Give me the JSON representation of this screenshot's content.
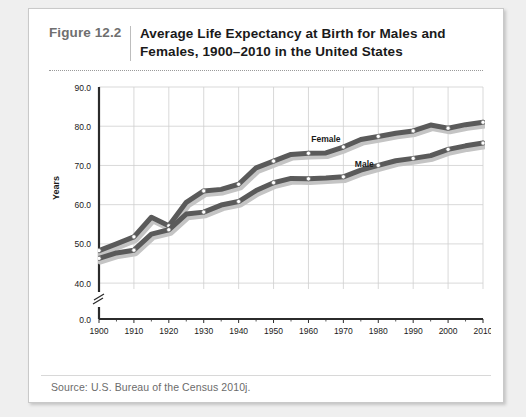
{
  "figure": {
    "number": "Figure 12.2",
    "title": "Average Life Expectancy at Birth for Males and Females, 1900–2010 in the United States",
    "source": "Source:  U.S. Bureau of the Census 2010j."
  },
  "chart_data": {
    "type": "line",
    "xlabel": "",
    "ylabel": "Years",
    "xlim": [
      1900,
      2010
    ],
    "ylim": [
      38.5,
      90.0
    ],
    "y_axis_break": true,
    "grid": true,
    "legend": "inline-annotations",
    "yticks": [
      "0.0",
      "40.0",
      "50.0",
      "60.0",
      "70.0",
      "80.0",
      "90.0"
    ],
    "ytick_values": [
      0.0,
      40.0,
      50.0,
      60.0,
      70.0,
      80.0,
      90.0
    ],
    "xticks": [
      "1900",
      "1910",
      "1920",
      "1930",
      "1940",
      "1950",
      "1960",
      "1970",
      "1980",
      "1990",
      "2000",
      "2010"
    ],
    "xtick_values": [
      1900,
      1910,
      1920,
      1930,
      1940,
      1950,
      1960,
      1970,
      1980,
      1990,
      2000,
      2010
    ],
    "x": [
      1900,
      1905,
      1910,
      1915,
      1920,
      1925,
      1930,
      1935,
      1940,
      1945,
      1950,
      1955,
      1960,
      1965,
      1970,
      1975,
      1980,
      1985,
      1990,
      1995,
      2000,
      2005,
      2010
    ],
    "series": [
      {
        "name": "Female",
        "label": "Female",
        "color": "#5a5a5a",
        "values": [
          48.3,
          50.0,
          51.8,
          56.8,
          54.6,
          60.6,
          63.5,
          63.9,
          65.2,
          69.4,
          71.1,
          72.8,
          73.1,
          73.2,
          74.7,
          76.6,
          77.4,
          78.2,
          78.8,
          80.3,
          79.5,
          80.4,
          81.0
        ]
      },
      {
        "name": "Male",
        "label": "Male",
        "color": "#5a5a5a",
        "values": [
          46.3,
          47.7,
          48.4,
          52.5,
          53.6,
          57.6,
          58.1,
          59.9,
          60.8,
          63.6,
          65.6,
          66.7,
          66.6,
          66.8,
          67.1,
          68.8,
          70.0,
          71.2,
          71.8,
          72.5,
          74.1,
          75.0,
          75.7
        ]
      }
    ],
    "annotations": [
      {
        "text": "Female",
        "x": 1965,
        "y": 76.0
      },
      {
        "text": "Male",
        "x": 1976,
        "y": 69.6
      }
    ]
  }
}
